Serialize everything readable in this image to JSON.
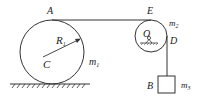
{
  "diagram": {
    "labels": {
      "A": "A",
      "E": "E",
      "D": "D",
      "B": "B",
      "C": "C",
      "O": "O",
      "R1": "R",
      "R1_sub": "1",
      "m1": "m",
      "m1_sub": "1",
      "m2": "m",
      "m2_sub": "2",
      "m3": "m",
      "m3_sub": "3"
    },
    "colors": {
      "stroke": "#333333",
      "text": "#222222",
      "background": "#ffffff"
    }
  }
}
